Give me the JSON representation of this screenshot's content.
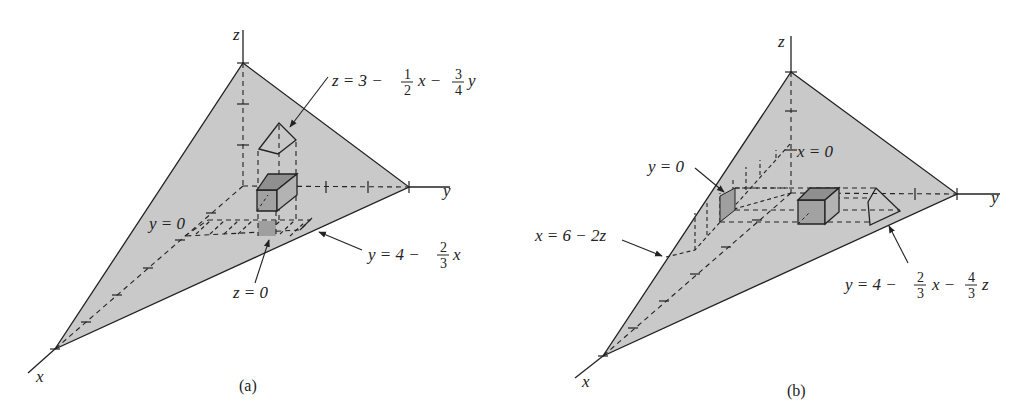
{
  "figure": {
    "panels": [
      {
        "id": "a",
        "caption": "(a)",
        "axes": {
          "x": "x",
          "y": "y",
          "z": "z"
        },
        "labels": {
          "plane_eq": {
            "lhs": "z = 3 −",
            "f1_num": "1",
            "f1_den": "2",
            "mid": "x −",
            "f2_num": "3",
            "f2_den": "4",
            "tail": "y"
          },
          "trace_eq": {
            "lhs": "y = 4 −",
            "f1_num": "2",
            "f1_den": "3",
            "tail": "x"
          },
          "y0": "y = 0",
          "z0": "z = 0"
        }
      },
      {
        "id": "b",
        "caption": "(b)",
        "axes": {
          "x": "x",
          "y": "y",
          "z": "z"
        },
        "labels": {
          "x0": "x = 0",
          "y0": "y = 0",
          "xz_eq": "x = 6 − 2z",
          "plane_eq": {
            "lhs": "y = 4 −",
            "f1_num": "2",
            "f1_den": "3",
            "mid": "x −",
            "f2_num": "4",
            "f2_den": "3",
            "tail": "z"
          }
        }
      }
    ],
    "colors": {
      "plane_fill": "#c9c9c9",
      "box_fill": "#a8a8a8",
      "stroke": "#222222",
      "background": "#ffffff"
    }
  }
}
